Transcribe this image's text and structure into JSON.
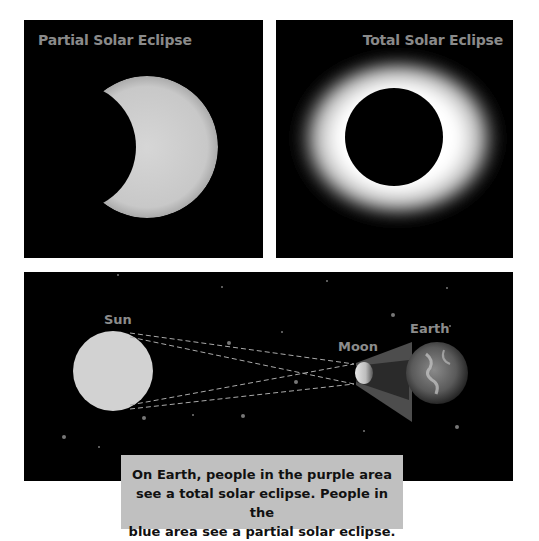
{
  "panels": {
    "partial": {
      "title": "Partial Solar Eclipse"
    },
    "total": {
      "title": "Total Solar Eclipse"
    }
  },
  "diagram": {
    "labels": {
      "sun": "Sun",
      "moon": "Moon",
      "earth": "Earth"
    }
  },
  "caption": {
    "lines": [
      "On Earth, people in the purple area",
      "see a total solar eclipse. People in the",
      "blue area see a partial solar eclipse."
    ]
  },
  "colors": {
    "background": "#000000",
    "title_text": "#8a8a8a",
    "caption_box": "#c0c0c0",
    "sun": "#d2d2d2"
  }
}
